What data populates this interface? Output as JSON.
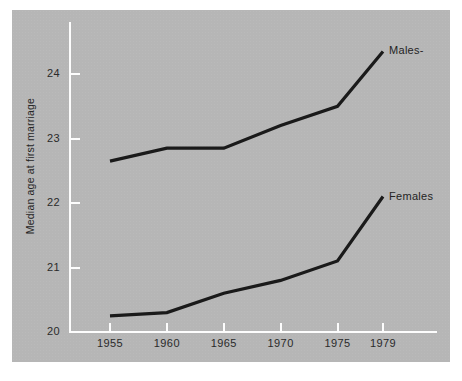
{
  "chart_data": {
    "type": "line",
    "title": "",
    "xlabel": "",
    "ylabel": "Median age at first marriage",
    "x": [
      1955,
      1960,
      1965,
      1970,
      1975,
      1979
    ],
    "xtick_labels": [
      "1955",
      "1960",
      "1965",
      "1970",
      "1975",
      "1979"
    ],
    "ytick_labels": [
      "20",
      "21",
      "22",
      "23",
      "24"
    ],
    "yticks": [
      20,
      21,
      22,
      23,
      24
    ],
    "xlim": [
      1953,
      1981
    ],
    "ylim": [
      20,
      24.8
    ],
    "grid": false,
    "legend_position": "inline-right-of-line-end",
    "line_color": "#1a1a1a",
    "panel_color": "#b6b6b6",
    "axis_color": "#fdfdfd",
    "text_color": "#2a2a2a",
    "series": [
      {
        "name": "Males",
        "label": "Males-",
        "values": [
          22.65,
          22.85,
          22.85,
          23.2,
          23.5,
          24.35
        ]
      },
      {
        "name": "Females",
        "label": "Females",
        "values": [
          20.25,
          20.3,
          20.6,
          20.8,
          21.1,
          22.1
        ]
      }
    ]
  },
  "caption": {
    "text": ""
  }
}
